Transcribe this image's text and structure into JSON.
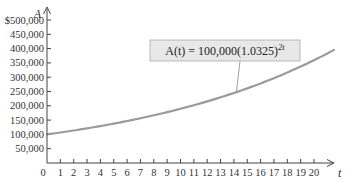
{
  "chart_data": {
    "type": "line",
    "title": "",
    "xlabel": "t",
    "ylabel": "A",
    "xlim": [
      0,
      21.5
    ],
    "ylim": [
      0,
      500000
    ],
    "x_ticks": [
      0,
      1,
      2,
      3,
      4,
      5,
      6,
      7,
      8,
      9,
      10,
      11,
      12,
      13,
      14,
      15,
      16,
      17,
      18,
      19,
      20
    ],
    "y_ticks": [
      50000,
      100000,
      150000,
      200000,
      250000,
      300000,
      350000,
      400000,
      450000,
      500000
    ],
    "y_tick_labels": [
      "50,000",
      "100,000",
      "150,000",
      "200,000",
      "250,000",
      "300,000",
      "350,000",
      "400,000",
      "450,000",
      "$500,000"
    ],
    "x_origin_label": "0",
    "grid": false,
    "series": [
      {
        "name": "A(t) = 100,000(1.0325)^{2t}",
        "function": "100000*Math.pow(1.0325, 2*t)",
        "color": "#999999",
        "x": [
          0,
          2,
          4,
          6,
          8,
          10,
          12,
          14,
          16,
          18,
          20,
          21.5
        ],
        "values": [
          100000,
          113648,
          129159,
          146786,
          166820,
          189588,
          215463,
          244870,
          278290,
          316271,
          359436,
          395000
        ]
      }
    ],
    "annotation": {
      "label_main": "A(t) = 100,000(1.0325)",
      "label_exponent": "2t",
      "points_to_t": 14.2
    }
  },
  "colors": {
    "axis": "#444444",
    "curve": "#9a9a9a",
    "label_bg": "#e8e8e8",
    "label_border": "#aaaaaa"
  }
}
